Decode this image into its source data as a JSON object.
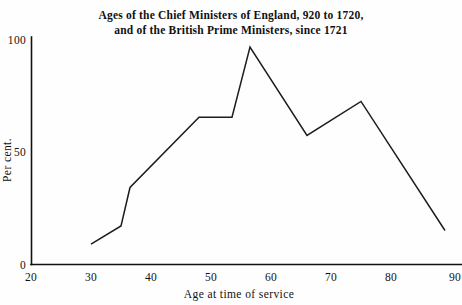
{
  "chart_data": {
    "type": "line",
    "title": "Ages of the Chief Ministers of England, 920 to 1720,\nand of the British Prime Ministers, since 1721",
    "title_line1": "Ages of the Chief Ministers of England, 920 to 1720,",
    "title_line2": "and of the British Prime Ministers, since 1721",
    "xlabel": "Age at time of service",
    "ylabel": "Per cent.",
    "xlim": [
      20,
      90
    ],
    "ylim": [
      0,
      100
    ],
    "grid": false,
    "legend": null,
    "xticks": [
      20,
      30,
      40,
      50,
      60,
      70,
      80,
      90
    ],
    "xtick_labels": [
      "20",
      "30",
      "40",
      "50",
      "60",
      "70",
      "80",
      "90"
    ],
    "yticks": [
      0,
      50,
      100
    ],
    "ytick_labels": [
      "0",
      "50",
      "100"
    ],
    "x": [
      30,
      35,
      36.5,
      48,
      53.5,
      56.5,
      66,
      75,
      89
    ],
    "y": [
      9,
      17,
      34,
      65,
      65,
      96,
      57,
      72,
      15
    ],
    "series": [
      {
        "name": "Age distribution",
        "points": [
          {
            "x": 30,
            "y": 9
          },
          {
            "x": 35,
            "y": 17
          },
          {
            "x": 36.5,
            "y": 34
          },
          {
            "x": 48,
            "y": 65
          },
          {
            "x": 53.5,
            "y": 65
          },
          {
            "x": 56.5,
            "y": 96
          },
          {
            "x": 66,
            "y": 57
          },
          {
            "x": 75,
            "y": 72
          },
          {
            "x": 89,
            "y": 15
          }
        ],
        "color": "#1c1c1c"
      }
    ]
  },
  "figure": {
    "background_color": "#fefefe",
    "axis_color": "#111111",
    "line_color": "#1c1c1c"
  }
}
